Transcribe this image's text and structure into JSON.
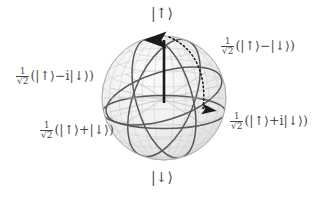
{
  "figure": {
    "type": "bloch-sphere",
    "title": "",
    "background_color": "#ffffff",
    "sphere": {
      "center_x": 164,
      "center_y": 98,
      "radius": 62,
      "fill_color": "#efefef",
      "mesh_color": "#c9c9c9",
      "great_circle_color": "#585858"
    },
    "vector": {
      "color": "#1a1a1a",
      "from": "center",
      "to": "north-pole",
      "description": "state vector pointing to up state"
    },
    "rotation_arrow": {
      "color": "#1a1a1a",
      "style": "dotted",
      "description": "dotted curved arrow from north pole sweeping to equator on the right"
    }
  },
  "labels": {
    "north_pole": {
      "text": "|↑⟩",
      "x": 151,
      "y": 8
    },
    "south_pole": {
      "text": "|↓⟩",
      "x": 151,
      "y": 172
    },
    "top_right": {
      "prefix_num": "1",
      "prefix_radical": "√2",
      "body": "(|↑⟩−|↓⟩)",
      "x": 221,
      "y": 38
    },
    "left": {
      "prefix_num": "1",
      "prefix_radical": "√2",
      "body": "(|↑⟩−i|↓⟩)",
      "x": 16,
      "y": 68
    },
    "right": {
      "prefix_num": "1",
      "prefix_radical": "√2",
      "body": "(|↑⟩+i|↓⟩)",
      "x": 230,
      "y": 113
    },
    "bottom_left": {
      "prefix_num": "1",
      "prefix_radical": "√2",
      "body": "(|↑⟩+|↓⟩)",
      "x": 40,
      "y": 122
    }
  }
}
